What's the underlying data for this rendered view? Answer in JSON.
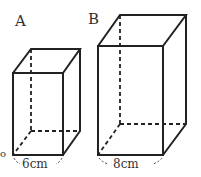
{
  "figures": [
    {
      "label": "A",
      "width_label": "6cm"
    },
    {
      "label": "B",
      "width_label": "8cm"
    }
  ],
  "stray_mark": "o"
}
